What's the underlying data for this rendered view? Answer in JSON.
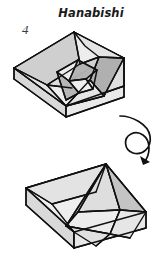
{
  "document": {
    "title": "Hanabishi",
    "step_number": "4",
    "type": "origami-instruction-diagram"
  },
  "symbols": {
    "turn_over_arrow": "rotate-turn-over-arrow"
  },
  "figures": {
    "upper": {
      "name": "folded-model-top-view",
      "description": "Three-dimensional box shape seen from above with a four-square pinwheel pattern folded in the centre"
    },
    "lower": {
      "name": "folded-model-rotated-view",
      "description": "Open box shape with triangular flaps standing inside, shown after rotation"
    }
  },
  "colors": {
    "ink": "#111111",
    "paper_light": "#efefef",
    "paper_mid": "#d6d6d6",
    "paper_dark": "#b4b4b4",
    "paper_darker": "#9e9e9e",
    "background": "#ffffff"
  }
}
